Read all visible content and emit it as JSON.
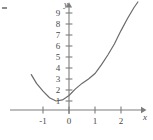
{
  "figure": {
    "axis_labels": {
      "x": "x",
      "y": "y"
    },
    "corner_mark": "",
    "colors": {
      "curve": "#6b6b6b",
      "axis": "#7d7d7d",
      "text": "#4a4a4a",
      "background": "#ffffff"
    }
  },
  "chart_data": {
    "type": "line",
    "title": "",
    "xlabel": "x",
    "ylabel": "y",
    "grid": false,
    "legend": null,
    "xlim": [
      -1.6,
      2.9
    ],
    "ylim": [
      -0.5,
      9.8
    ],
    "xticks": [
      -1,
      0,
      1,
      2
    ],
    "xtick_labels": [
      "-1",
      "0",
      "1",
      "2"
    ],
    "yticks": [
      1,
      2,
      3,
      4,
      5,
      6,
      7,
      8,
      9
    ],
    "ytick_labels": [
      "1",
      "2",
      "3",
      "4",
      "5",
      "6",
      "7",
      "8",
      "9"
    ],
    "series": [
      {
        "name": "parabola",
        "comment": "upward parabola, vertex near (-0.5, 1)",
        "x": [
          -1.45,
          -1.25,
          -1.0,
          -0.75,
          -0.5,
          -0.25,
          0.0,
          0.25,
          0.5,
          0.75,
          1.0,
          1.25,
          1.5,
          1.75,
          2.0,
          2.25,
          2.5,
          2.65
        ],
        "y": [
          3.4,
          2.6,
          1.9,
          1.3,
          1.0,
          1.1,
          1.5,
          2.1,
          2.6,
          3.0,
          3.5,
          4.3,
          5.2,
          6.2,
          7.4,
          8.5,
          9.5,
          10.0
        ]
      }
    ]
  }
}
